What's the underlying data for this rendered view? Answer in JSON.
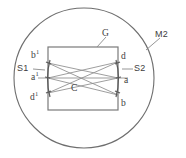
{
  "figure": {
    "type": "optical-ray-diagram",
    "background_color": "#ffffff",
    "line_color": "#6e6e6e",
    "text_color": "#3d3d3d"
  },
  "labels": {
    "mirror_outer": "M2",
    "grating": "G",
    "slit_left": "S1",
    "slit_right": "S2",
    "center": "C",
    "left_top": "b",
    "left_top_sup": "1",
    "left_mid": "a",
    "left_mid_sup": "1",
    "left_bottom": "d",
    "left_bottom_sup": "1",
    "right_top": "d",
    "right_mid": "a",
    "right_bottom": "b"
  },
  "geometry": {
    "circle": {
      "cx": 84,
      "cy": 78,
      "r": 70
    },
    "rect": {
      "x": 48,
      "y": 47,
      "width": 70,
      "height": 63
    },
    "axis_y": 78,
    "arc_left_x": 48,
    "arc_right_x": 118,
    "arc_top_y": 62,
    "arc_bottom_y": 96
  }
}
